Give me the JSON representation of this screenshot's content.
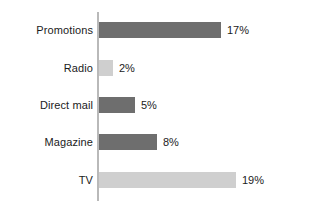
{
  "chart_data": {
    "type": "bar",
    "orientation": "horizontal",
    "title": "",
    "subtitle": "",
    "xlabel": "",
    "ylabel": "",
    "categories": [
      "Promotions",
      "Radio",
      "Direct mail",
      "Magazine",
      "TV"
    ],
    "values": [
      17,
      2,
      5,
      8,
      19
    ],
    "value_labels": [
      "17%",
      "2%",
      "5%",
      "8%",
      "19%"
    ],
    "units": "percent",
    "xlim": [
      0,
      21
    ],
    "grid": false,
    "legend": false,
    "legend_position": "none",
    "bar_colors": [
      "#6e6e6e",
      "#cfcfcf",
      "#6e6e6e",
      "#6e6e6e",
      "#cfcfcf"
    ],
    "series": [
      {
        "name": "Share",
        "values": [
          17,
          2,
          5,
          8,
          19
        ]
      }
    ],
    "axis_color": "#b9b9b9",
    "background_color": "#ffffff",
    "text_color": "#1b1b1b"
  },
  "layout": {
    "axis_x": 97,
    "bar_start_x": 99,
    "px_per_percent": 7.2,
    "row_tops": [
      22,
      60,
      97,
      134,
      172
    ],
    "bar_height": 16,
    "label_gap": 6
  }
}
